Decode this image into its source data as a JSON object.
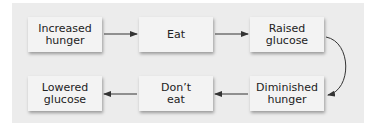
{
  "diagram": {
    "type": "flowchart",
    "nodes": [
      {
        "id": "n1",
        "label": "Increased\nhunger",
        "line1": "Increased",
        "line2": "hunger"
      },
      {
        "id": "n2",
        "label": "Eat",
        "line1": "Eat",
        "line2": ""
      },
      {
        "id": "n3",
        "label": "Raised\nglucose",
        "line1": "Raised",
        "line2": "glucose"
      },
      {
        "id": "n4",
        "label": "Diminished\nhunger",
        "line1": "Diminished",
        "line2": "hunger"
      },
      {
        "id": "n5",
        "label": "Don't\neat",
        "line1": "Don’t",
        "line2": "eat"
      },
      {
        "id": "n6",
        "label": "Lowered\nglucose",
        "line1": "Lowered",
        "line2": "glucose"
      }
    ],
    "edges": [
      {
        "from": "n1",
        "to": "n2"
      },
      {
        "from": "n2",
        "to": "n3"
      },
      {
        "from": "n3",
        "to": "n4"
      },
      {
        "from": "n4",
        "to": "n5"
      },
      {
        "from": "n5",
        "to": "n6"
      }
    ],
    "colors": {
      "panel": "#ececec",
      "box": "#f3f3f3",
      "arrow": "#333333",
      "text": "#222222"
    }
  }
}
